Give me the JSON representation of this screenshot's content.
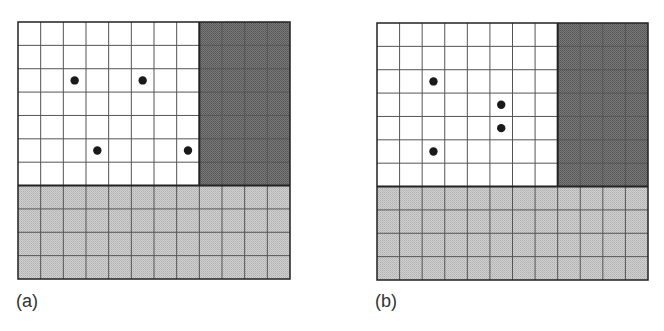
{
  "figure": {
    "panels": [
      {
        "label": "(a)",
        "grid": {
          "cols": 12,
          "rows": 11,
          "left": 17,
          "top": 21,
          "width": 272,
          "height": 257
        },
        "regions": [
          {
            "name": "white-region",
            "col": 0,
            "row": 0,
            "cols": 8,
            "rows": 7,
            "fill": "#ffffff"
          },
          {
            "name": "dark-region",
            "col": 8,
            "row": 0,
            "cols": 4,
            "rows": 7,
            "fill": "#6e6e6e"
          },
          {
            "name": "light-region",
            "col": 0,
            "row": 7,
            "cols": 12,
            "rows": 4,
            "fill": "#c8c8c8"
          }
        ],
        "dots": [
          {
            "col": 2,
            "row": 2
          },
          {
            "col": 5,
            "row": 2
          },
          {
            "col": 3,
            "row": 5
          },
          {
            "col": 7,
            "row": 5
          }
        ]
      },
      {
        "label": "(b)",
        "grid": {
          "cols": 12,
          "rows": 11,
          "left": 376,
          "top": 22,
          "width": 271,
          "height": 257
        },
        "regions": [
          {
            "name": "white-region",
            "col": 0,
            "row": 0,
            "cols": 8,
            "rows": 7,
            "fill": "#ffffff"
          },
          {
            "name": "dark-region",
            "col": 8,
            "row": 0,
            "cols": 4,
            "rows": 7,
            "fill": "#6e6e6e"
          },
          {
            "name": "light-region",
            "col": 0,
            "row": 7,
            "cols": 12,
            "rows": 4,
            "fill": "#c8c8c8"
          }
        ],
        "dots": [
          {
            "col": 2,
            "row": 2
          },
          {
            "col": 5,
            "row": 3
          },
          {
            "col": 5,
            "row": 4
          },
          {
            "col": 2,
            "row": 5
          }
        ]
      }
    ],
    "colors": {
      "grid_line": "#555555",
      "border": "#222222",
      "dot": "#1a1a1a"
    }
  }
}
